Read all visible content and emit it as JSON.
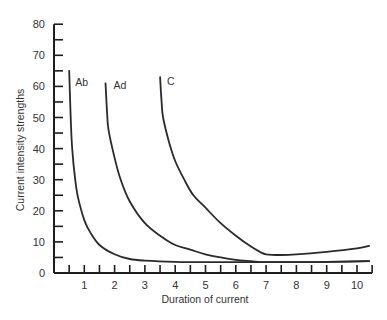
{
  "chart_data": {
    "type": "line",
    "title": "",
    "xlabel": "Duration of current",
    "ylabel": "Current intensity strengths",
    "xlim": [
      0,
      10.5
    ],
    "ylim": [
      0,
      80
    ],
    "x_ticks": [
      1,
      2,
      3,
      4,
      5,
      6,
      7,
      8,
      9,
      10
    ],
    "y_ticks": [
      0,
      10,
      20,
      30,
      40,
      50,
      60,
      70,
      80
    ],
    "grid": false,
    "legend": "inline curve labels",
    "series": [
      {
        "name": "Ab",
        "x": [
          0.5,
          0.55,
          0.6,
          0.7,
          0.8,
          1.0,
          1.2,
          1.5,
          2.0,
          2.5,
          3.0,
          4.0,
          5.0,
          6.0,
          7.0,
          8.0,
          9.0,
          10.4
        ],
        "y": [
          65,
          50,
          40,
          30,
          24,
          17,
          13,
          9,
          6,
          4.5,
          4,
          3.6,
          3.5,
          3.5,
          3.5,
          3.5,
          3.6,
          3.8
        ]
      },
      {
        "name": "Ad",
        "x": [
          1.7,
          1.75,
          1.8,
          2.0,
          2.2,
          2.5,
          3.0,
          3.5,
          4.0,
          4.5,
          5.0,
          5.5,
          6.0,
          6.5,
          7.0,
          8.0,
          9.0,
          10.4
        ],
        "y": [
          61,
          52,
          46,
          37,
          30,
          23,
          16,
          12,
          9,
          7.5,
          6,
          5,
          4.2,
          3.8,
          3.5,
          3.5,
          3.6,
          3.8
        ]
      },
      {
        "name": "C",
        "x": [
          3.5,
          3.55,
          3.6,
          3.8,
          4.0,
          4.3,
          4.6,
          5.0,
          5.5,
          6.0,
          6.5,
          6.8,
          7.0,
          7.5,
          8.0,
          9.0,
          10.0,
          10.4
        ],
        "y": [
          63,
          55,
          50,
          42,
          36,
          30,
          25,
          21,
          16,
          12,
          8.5,
          6.8,
          6,
          5.8,
          6,
          6.8,
          7.9,
          8.7
        ]
      }
    ]
  },
  "axes": {
    "x_label": "Duration of current",
    "y_label": "Current intensity strengths"
  },
  "colors": {
    "line": "#2a2a2a",
    "axis": "#1e1e1e",
    "text": "#333333",
    "background": "#ffffff"
  }
}
